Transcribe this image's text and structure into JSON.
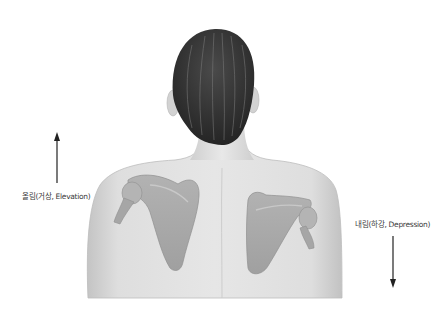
{
  "diagram": {
    "labels": {
      "elevation": "올림(거상, Elevation)",
      "depression": "내림(하강, Depression)"
    },
    "arrows": {
      "elevation": {
        "direction": "up",
        "x": 57,
        "y_top": 133,
        "y_bottom": 183
      },
      "depression": {
        "direction": "down",
        "x": 393,
        "y_top": 236,
        "y_bottom": 287
      }
    },
    "colors": {
      "background": "#ffffff",
      "skin": "#d8d8d8",
      "skin_light": "#ececec",
      "skin_shadow": "#b8b8b8",
      "scapula": "#a9a9a9",
      "scapula_dark": "#8e8e8e",
      "hair": "#2e2e2e",
      "hair_highlight": "#6a6a6a",
      "arrow": "#222222",
      "label_text": "#3a3a3a"
    }
  }
}
